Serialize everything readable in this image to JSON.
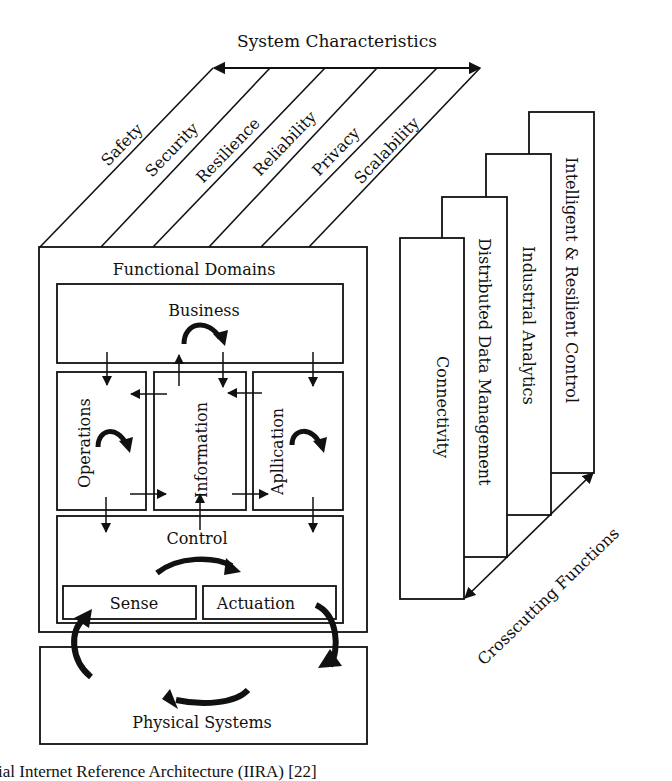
{
  "diagram": {
    "system_characteristics": {
      "label": "System Characteristics",
      "items": [
        "Safety",
        "Security",
        "Resilience",
        "Reliability",
        "Privacy",
        "Scalability"
      ]
    },
    "functional_domains": {
      "label": "Functional Domains",
      "business": "Business",
      "operations": "Operations",
      "information": "Information",
      "application": "Apllication",
      "control": "Control",
      "sense": "Sense",
      "actuation": "Actuation"
    },
    "physical_systems": "Physical Systems",
    "crosscutting_functions": {
      "label": "Crosscutting Functions",
      "items": [
        "Connectivity",
        "Distributed Data Management",
        "Industrial Analytics",
        "Intelligent & Resilient Control"
      ]
    },
    "caption": "ial Internet Reference Architecture (IIRA) [22]"
  }
}
